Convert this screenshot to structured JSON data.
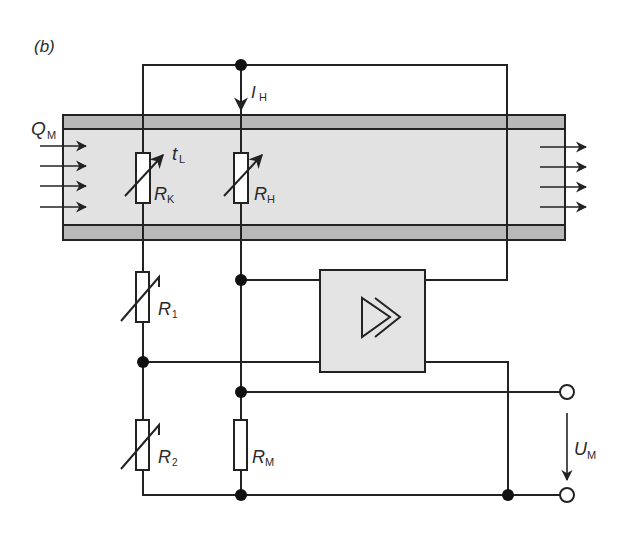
{
  "figure": {
    "panel_label": "(b)",
    "colors": {
      "line": "#222222",
      "pipe_wall": "#b8b8b8",
      "pipe_fluid": "#e2e2e2",
      "amplifier_fill": "#e4e4e4",
      "background": "#ffffff"
    }
  },
  "labels": {
    "flow": {
      "main": "Q",
      "sub": "M"
    },
    "heating_current": {
      "main": "I",
      "sub": "H"
    },
    "temperature": {
      "main": "t",
      "sub": "L"
    },
    "r_k": {
      "main": "R",
      "sub": "K"
    },
    "r_h": {
      "main": "R",
      "sub": "H"
    },
    "r_1": {
      "main": "R",
      "sub": "1"
    },
    "r_2": {
      "main": "R",
      "sub": "2"
    },
    "r_m": {
      "main": "R",
      "sub": "M"
    },
    "output_voltage": {
      "main": "U",
      "sub": "M"
    }
  },
  "components": [
    {
      "id": "R_K",
      "type": "variable-resistor",
      "location": "in pipe"
    },
    {
      "id": "R_H",
      "type": "variable-resistor",
      "location": "in pipe"
    },
    {
      "id": "R_1",
      "type": "variable-resistor"
    },
    {
      "id": "R_2",
      "type": "variable-resistor"
    },
    {
      "id": "R_M",
      "type": "resistor"
    },
    {
      "id": "amplifier",
      "type": "amplifier",
      "symbol": "double-triangle"
    }
  ]
}
